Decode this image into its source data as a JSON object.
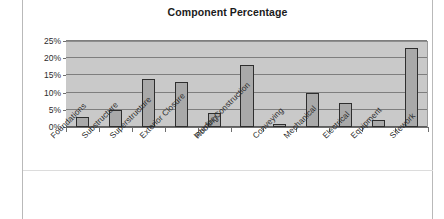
{
  "chart_data": {
    "type": "bar",
    "title": "Component Percentage",
    "xlabel": "",
    "ylabel": "",
    "ylim": [
      0,
      25
    ],
    "ytick_values": [
      0,
      5,
      10,
      15,
      20,
      25
    ],
    "ytick_labels": [
      "0%",
      "5%",
      "10%",
      "15%",
      "20%",
      "25%"
    ],
    "grid": true,
    "legend": false,
    "unit": "%",
    "categories": [
      "Foundations",
      "Substructure",
      "Superstructure",
      "Exterior Closure",
      "Roofing",
      "Interior Construction",
      "Conveying",
      "Mechanical",
      "Electrical",
      "Equipment",
      "Sitework"
    ],
    "values": [
      3,
      5,
      14,
      13,
      4,
      18,
      1,
      10,
      7,
      2,
      23
    ],
    "series": [
      {
        "name": "Component Percentage",
        "values": [
          3,
          5,
          14,
          13,
          4,
          18,
          1,
          10,
          7,
          2,
          23
        ]
      }
    ]
  },
  "style": {
    "plot_background": "#c9c9c9",
    "bar_fill": "#a9a9a9",
    "bar_outline": "#2e2e2e",
    "gridline_color": "#7e7e7e",
    "axis_color": "#6f6f6f",
    "text_color": "#2b2b2b",
    "title_color": "#1b1b1b",
    "page_background": "#ffffff"
  }
}
